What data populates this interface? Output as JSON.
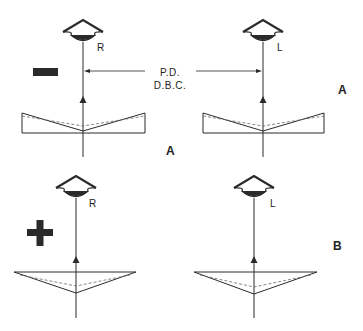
{
  "diagram": {
    "panel_a": {
      "label_top_right": "A",
      "label_bottom": "A",
      "sign": "minus",
      "right_eye_label": "R",
      "left_eye_label": "L",
      "measure_label_line1": "P.D.",
      "measure_label_line2": "D.B.C.",
      "prism_orientation": "base-out"
    },
    "panel_b": {
      "label": "B",
      "sign": "plus",
      "right_eye_label": "R",
      "left_eye_label": "L",
      "prism_orientation": "base-in"
    },
    "colors": {
      "ink": "#2a2a2a",
      "background": "#ffffff"
    }
  }
}
